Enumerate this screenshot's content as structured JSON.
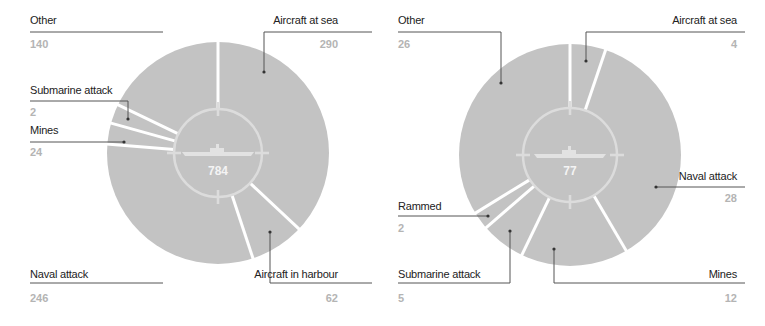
{
  "colors": {
    "slice": "#c3c3c3",
    "separator": "#ffffff",
    "leader": "#333333",
    "label": "#222222",
    "value": "#b4b4b4",
    "center_ring": "#dcdcdc"
  },
  "chart_data": [
    {
      "type": "pie",
      "subtype": "donut",
      "title": "",
      "total_label": "784",
      "total": 784,
      "slices": [
        {
          "label": "Aircraft at sea",
          "value": 290,
          "display": "290"
        },
        {
          "label": "Aircraft in harbour",
          "value": 62,
          "display": "62"
        },
        {
          "label": "Naval attack",
          "value": 246,
          "display": "246"
        },
        {
          "label": "Mines",
          "value": 24,
          "display": "24"
        },
        {
          "label": "Submarine attack",
          "value": 22,
          "display": "2"
        },
        {
          "label": "Other",
          "value": 140,
          "display": "140"
        }
      ]
    },
    {
      "type": "pie",
      "subtype": "donut",
      "title": "",
      "total_label": "77",
      "total": 77,
      "slices": [
        {
          "label": "Aircraft at sea",
          "value": 4,
          "display": "4"
        },
        {
          "label": "Naval attack",
          "value": 28,
          "display": "28"
        },
        {
          "label": "Mines",
          "value": 12,
          "display": "12"
        },
        {
          "label": "Submarine attack",
          "value": 5,
          "display": "5"
        },
        {
          "label": "Rammed",
          "value": 2,
          "display": "2"
        },
        {
          "label": "Other",
          "value": 26,
          "display": "26"
        }
      ]
    }
  ],
  "left": {
    "total": "784",
    "labels": {
      "other": {
        "name": "Other",
        "value": "140"
      },
      "submarine": {
        "name": "Submarine attack",
        "value": "2"
      },
      "mines": {
        "name": "Mines",
        "value": "24"
      },
      "naval": {
        "name": "Naval attack",
        "value": "246"
      },
      "air_sea": {
        "name": "Aircraft at sea",
        "value": "290"
      },
      "air_harbour": {
        "name": "Aircraft in harbour",
        "value": "62"
      }
    }
  },
  "right": {
    "total": "77",
    "labels": {
      "other": {
        "name": "Other",
        "value": "26"
      },
      "air_sea": {
        "name": "Aircraft at sea",
        "value": "4"
      },
      "naval": {
        "name": "Naval attack",
        "value": "28"
      },
      "rammed": {
        "name": "Rammed",
        "value": "2"
      },
      "submarine": {
        "name": "Submarine attack",
        "value": "5"
      },
      "mines": {
        "name": "Mines",
        "value": "12"
      }
    }
  },
  "icons": {
    "center": "submarine-silhouette-icon"
  }
}
